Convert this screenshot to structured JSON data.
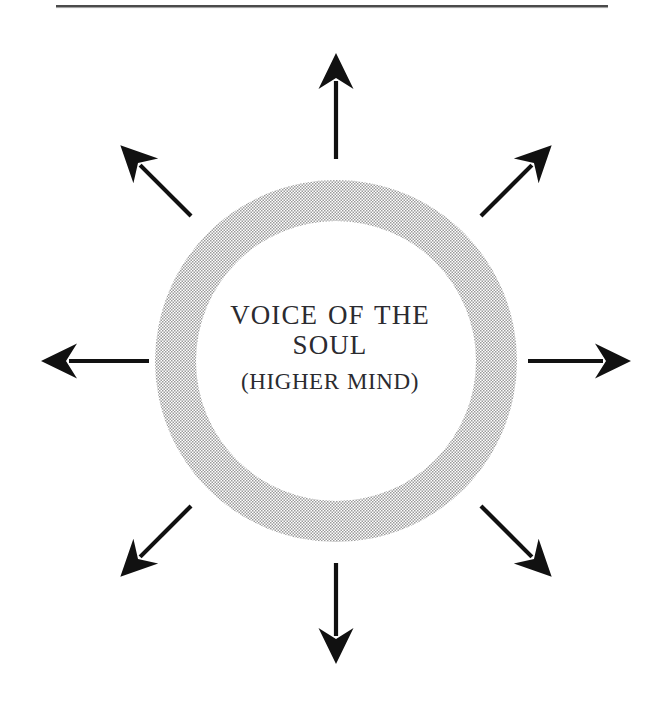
{
  "page": {
    "width": 660,
    "height": 707,
    "background_color": "#ffffff"
  },
  "rule": {
    "name": "top-horizontal-rule",
    "x_start": 56,
    "x_end": 608,
    "y": 6,
    "thickness": 2,
    "color": "#4a4a4a"
  },
  "diagram": {
    "type": "radiating-circle",
    "title": "VOICE OF THE SOUL (HIGHER MIND)",
    "center": {
      "x": 336,
      "y": 361
    },
    "ring": {
      "name": "soul-ring",
      "outer_radius": 181,
      "inner_radius": 140,
      "fill_color": "#d2d2d2",
      "texture": "halftone-checker"
    },
    "caption": {
      "main": "VOICE OF THE\nSOUL",
      "sub": "(HIGHER MIND)",
      "color": "#2b2b30"
    },
    "arrow_color": "#111111",
    "arrow_count": 8,
    "arrows": [
      {
        "label": "arrow-north",
        "angle_deg": 270,
        "tail_radius": 202,
        "tip_radius": 308
      },
      {
        "label": "arrow-northeast",
        "angle_deg": 315,
        "tail_radius": 205,
        "tip_radius": 305
      },
      {
        "label": "arrow-east",
        "angle_deg": 0,
        "tail_radius": 192,
        "tip_radius": 295
      },
      {
        "label": "arrow-southeast",
        "angle_deg": 45,
        "tail_radius": 205,
        "tip_radius": 305
      },
      {
        "label": "arrow-south",
        "angle_deg": 90,
        "tail_radius": 202,
        "tip_radius": 303
      },
      {
        "label": "arrow-southwest",
        "angle_deg": 135,
        "tail_radius": 205,
        "tip_radius": 305
      },
      {
        "label": "arrow-west",
        "angle_deg": 180,
        "tail_radius": 187,
        "tip_radius": 295
      },
      {
        "label": "arrow-northwest",
        "angle_deg": 225,
        "tail_radius": 205,
        "tip_radius": 305
      }
    ]
  }
}
